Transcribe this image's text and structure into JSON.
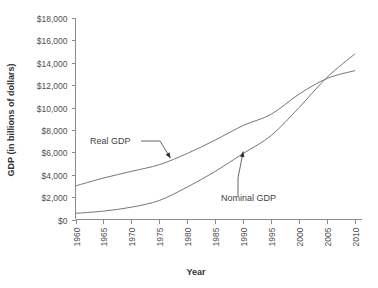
{
  "chart_data": {
    "type": "line",
    "title": "",
    "xlabel": "Year",
    "ylabel": "GDP (in billions of dollars)",
    "x": [
      1960,
      1965,
      1970,
      1975,
      1980,
      1985,
      1990,
      1995,
      2000,
      2005,
      2010
    ],
    "xtick_labels": [
      "1960",
      "1965",
      "1970",
      "1975",
      "1980",
      "1985",
      "1990",
      "1995",
      "2000",
      "2005",
      "2010"
    ],
    "ytick_labels": [
      "$0",
      "$2,000",
      "$4,000",
      "$6,000",
      "$8,000",
      "$10,000",
      "$12,000",
      "$14,000",
      "$16,000",
      "$18,000"
    ],
    "ytick_values": [
      0,
      2000,
      4000,
      6000,
      8000,
      10000,
      12000,
      14000,
      16000,
      18000
    ],
    "ylim": [
      0,
      18000
    ],
    "xlim": [
      1960,
      2010
    ],
    "grid": false,
    "legend_position": "inline-annotations",
    "series": [
      {
        "name": "Real GDP",
        "color": "#767676",
        "values": [
          3000,
          3700,
          4300,
          4900,
          5900,
          7100,
          8400,
          9400,
          11200,
          12600,
          13300
        ]
      },
      {
        "name": "Nominal GDP",
        "color": "#767676",
        "values": [
          550,
          750,
          1100,
          1700,
          2900,
          4300,
          5900,
          7500,
          10000,
          12700,
          14800
        ]
      }
    ],
    "annotations": [
      {
        "text": "Real GDP",
        "series": "Real GDP",
        "points_to_year": 1977
      },
      {
        "text": "Nominal GDP",
        "series": "Nominal GDP",
        "points_to_year": 1990
      }
    ]
  }
}
